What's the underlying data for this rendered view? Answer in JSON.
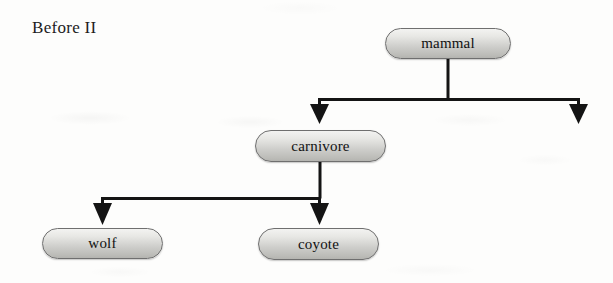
{
  "title": "Before II",
  "diagram": {
    "type": "tree",
    "orientation": "top-down",
    "line_color": "#141414",
    "node_fill_top": "#f3f3f1",
    "node_fill_bottom": "#b4b4b0",
    "node_border_color": "#6f6f6f",
    "nodes": [
      {
        "id": "mammal",
        "label": "mammal",
        "level": 0
      },
      {
        "id": "carnivore",
        "label": "carnivore",
        "level": 1
      },
      {
        "id": "wolf",
        "label": "wolf",
        "level": 2
      },
      {
        "id": "coyote",
        "label": "coyote",
        "level": 2
      }
    ],
    "edges": [
      {
        "from": "mammal",
        "to": "carnivore",
        "arrow": "down"
      },
      {
        "from": "mammal",
        "to": null,
        "arrow": "down",
        "note": "unlabeled dangling branch to the right"
      },
      {
        "from": "carnivore",
        "to": "wolf",
        "arrow": "down"
      },
      {
        "from": "carnivore",
        "to": "coyote",
        "arrow": "down"
      }
    ]
  }
}
